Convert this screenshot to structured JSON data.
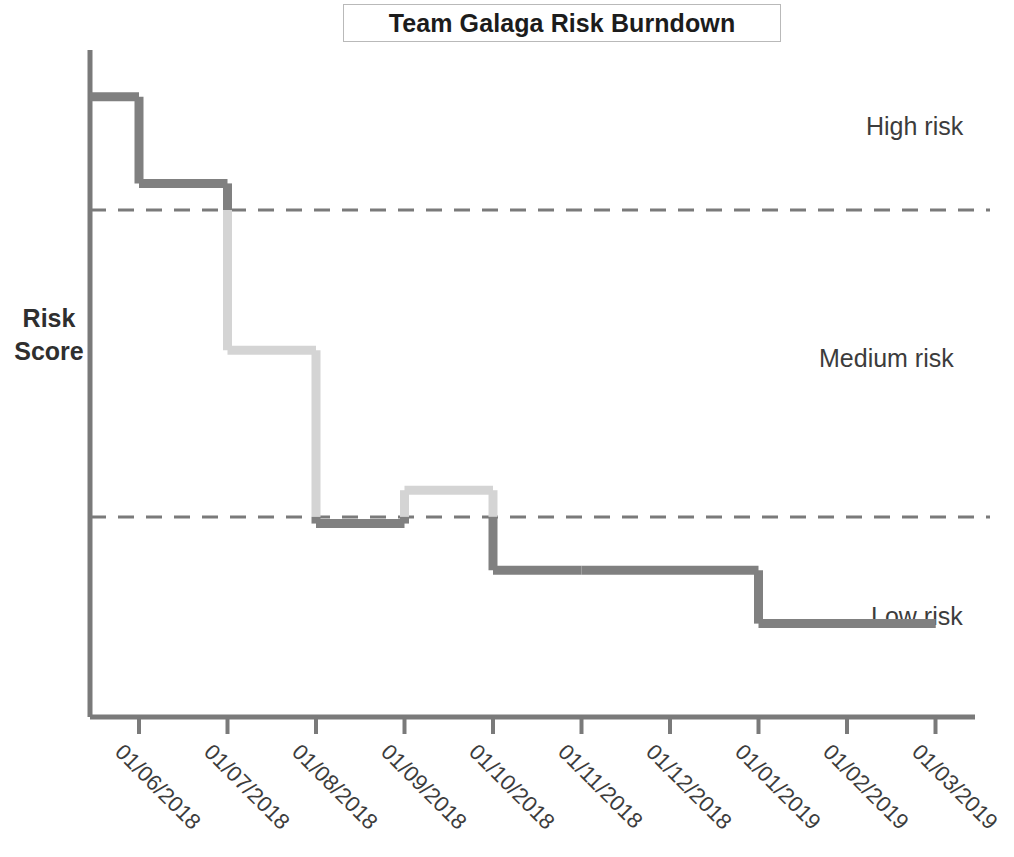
{
  "chart_data": {
    "type": "line",
    "title": "Team Galaga Risk Burndown",
    "xlabel": "",
    "ylabel": "Risk Score",
    "grid": false,
    "legend_position": "right-inline",
    "step_style": "post",
    "x": [
      "01/05/2018",
      "01/06/2018",
      "01/07/2018",
      "01/08/2018",
      "01/09/2018",
      "01/10/2018",
      "01/11/2018",
      "01/12/2018",
      "01/01/2019",
      "01/02/2019",
      "01/03/2019"
    ],
    "tick_labels": [
      "01/06/2018",
      "01/07/2018",
      "01/08/2018",
      "01/09/2018",
      "01/10/2018",
      "01/11/2018",
      "01/12/2018",
      "01/01/2019",
      "01/02/2019",
      "01/03/2019"
    ],
    "series": [
      {
        "name": "Risk Score",
        "values": [
          93,
          80,
          55,
          29,
          34,
          22,
          22,
          22,
          14,
          14,
          14
        ]
      }
    ],
    "ylim": [
      0,
      100
    ],
    "thresholds": [
      {
        "name": "high-medium-threshold",
        "value": 76,
        "label": "High risk boundary",
        "style": "dashed"
      },
      {
        "name": "medium-low-threshold",
        "value": 30,
        "label": "Low risk boundary",
        "style": "dashed"
      }
    ],
    "zones": [
      {
        "label": "High risk",
        "range": [
          76,
          100
        ]
      },
      {
        "label": "Medium risk",
        "range": [
          30,
          76
        ]
      },
      {
        "label": "Low risk",
        "range": [
          0,
          30
        ]
      }
    ],
    "colors": {
      "line_dark": "#808080",
      "line_light": "#d4d4d4",
      "axis": "#7a7a7a",
      "threshold": "#7a7a7a",
      "title_border": "#b9b9b9",
      "text": "#3c3c3c"
    }
  },
  "title": {
    "text": "Team Galaga Risk Burndown"
  },
  "axes": {
    "y_title_line1": "Risk",
    "y_title_line2": "Score"
  },
  "zone_labels": {
    "high": "High risk",
    "medium": "Medium risk",
    "low": "Low risk"
  },
  "x_ticks": [
    "01/06/2018",
    "01/07/2018",
    "01/08/2018",
    "01/09/2018",
    "01/10/2018",
    "01/11/2018",
    "01/12/2018",
    "01/01/2019",
    "01/02/2019",
    "01/03/2019"
  ]
}
